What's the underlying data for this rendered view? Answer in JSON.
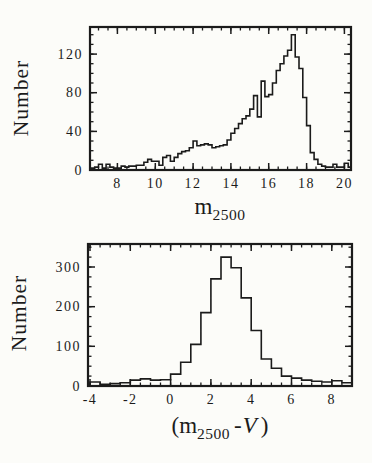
{
  "figure": {
    "background": "#fcfcf9",
    "ink": "#1b1b1b"
  },
  "labels": {
    "top_ylabel": "Number",
    "bottom_ylabel": "Number",
    "top_xlabel": {
      "base": "m",
      "sub": "2500"
    },
    "bottom_xlabel": {
      "open": "(m",
      "sub": "2500",
      "mid": "-",
      "var": "V",
      "close": ")"
    }
  },
  "chart_data": [
    {
      "id": "top",
      "type": "bar",
      "subtype": "step-histogram",
      "title": "",
      "xlabel": "m_2500",
      "ylabel": "Number",
      "bin_start": 6.6,
      "bin_width": 0.2,
      "values": [
        2,
        3,
        6,
        2,
        6,
        3,
        2,
        2,
        4,
        3,
        4,
        4,
        5,
        5,
        8,
        11,
        9,
        9,
        5,
        13,
        15,
        9,
        13,
        17,
        19,
        20,
        23,
        30,
        25,
        26,
        27,
        26,
        23,
        24,
        25,
        26,
        31,
        38,
        43,
        48,
        53,
        56,
        63,
        77,
        55,
        92,
        76,
        78,
        90,
        103,
        110,
        118,
        124,
        140,
        117,
        105,
        75,
        46,
        18,
        11,
        6,
        4,
        3,
        3,
        6,
        3,
        3,
        7,
        3
      ],
      "xlim": [
        6.55,
        20.35
      ],
      "ylim": [
        0,
        148
      ],
      "x_major_ticks": [
        8,
        10,
        12,
        14,
        16,
        18,
        20
      ],
      "x_minor_step": 0.5,
      "y_major_ticks": [
        0,
        40,
        80,
        120
      ],
      "y_minor_step": 10,
      "grid": false,
      "legend": false
    },
    {
      "id": "bottom",
      "type": "bar",
      "subtype": "step-histogram",
      "title": "",
      "xlabel": "(m_2500 - V)",
      "ylabel": "Number",
      "bin_start": -4.0,
      "bin_width": 0.5,
      "values": [
        10,
        4,
        6,
        8,
        15,
        18,
        15,
        16,
        30,
        60,
        105,
        185,
        270,
        325,
        298,
        222,
        140,
        68,
        45,
        25,
        20,
        15,
        12,
        10,
        13,
        8
      ],
      "xlim": [
        -4.1,
        9.0
      ],
      "ylim": [
        0,
        358
      ],
      "x_major_ticks": [
        -4,
        -2,
        0,
        2,
        4,
        6,
        8
      ],
      "x_minor_step": 0.5,
      "y_major_ticks": [
        0,
        100,
        200,
        300
      ],
      "y_minor_step": 25,
      "grid": false,
      "legend": false
    }
  ]
}
